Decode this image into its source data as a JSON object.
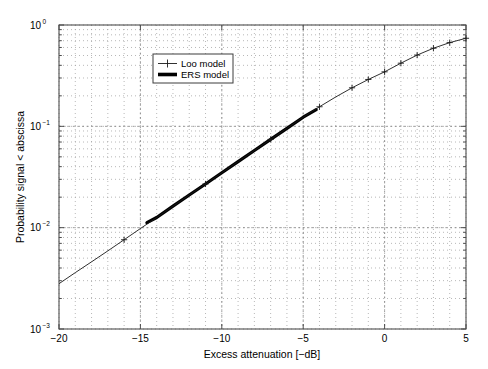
{
  "chart_data": {
    "type": "line",
    "title": "",
    "xlabel": "Excess attenuation [−dB]",
    "ylabel": "Probability signal < abscissa",
    "xlim": [
      -20,
      5
    ],
    "ylim": [
      0.001,
      1
    ],
    "yscale": "log",
    "xscale": "linear",
    "grid": true,
    "grid_style": "dotted-minor-dashed-major",
    "legend_position": "upper-left-inset",
    "xticks": [
      "−20",
      "−15",
      "−10",
      "−5",
      "0",
      "5"
    ],
    "xtick_values": [
      -20,
      -15,
      -10,
      -5,
      0,
      5
    ],
    "yticks": [
      "10^0",
      "10^-1",
      "10^-2",
      "10^-3"
    ],
    "ytick_values": [
      1,
      0.1,
      0.01,
      0.001
    ],
    "ytick_mantissa": [
      "10",
      "10",
      "10",
      "10"
    ],
    "ytick_exponents": [
      "0",
      "−1",
      "−2",
      "−3"
    ],
    "series": [
      {
        "name": "Loo model",
        "style": "thin-line-with-plus-markers",
        "marker": "+",
        "linewidth": 0.9,
        "color": "#1a1a1a",
        "x": [
          -20,
          -19,
          -18,
          -17,
          -16,
          -15,
          -14,
          -13,
          -12,
          -11,
          -10,
          -9,
          -8,
          -7,
          -6,
          -5,
          -4,
          -3,
          -2,
          -1,
          0,
          1,
          2,
          3,
          4,
          5
        ],
        "y": [
          0.0028,
          0.0036,
          0.0046,
          0.0059,
          0.0076,
          0.0098,
          0.0126,
          0.0163,
          0.021,
          0.027,
          0.0348,
          0.0448,
          0.0577,
          0.0743,
          0.0956,
          0.123,
          0.156,
          0.195,
          0.24,
          0.29,
          0.345,
          0.42,
          0.505,
          0.59,
          0.67,
          0.74
        ],
        "marker_x": [
          -16,
          -11,
          -7,
          -4,
          -2,
          -1,
          0,
          1,
          2,
          3,
          4,
          5
        ],
        "marker_y": [
          0.0076,
          0.027,
          0.0743,
          0.156,
          0.24,
          0.29,
          0.345,
          0.42,
          0.505,
          0.59,
          0.67,
          0.74
        ]
      },
      {
        "name": "ERS model",
        "style": "thick-line",
        "marker": "none",
        "linewidth": 3.2,
        "color": "#000000",
        "x": [
          -14.6,
          -14,
          -13,
          -12,
          -11,
          -10,
          -9,
          -8,
          -7,
          -6,
          -5,
          -4.2
        ],
        "y": [
          0.0112,
          0.0126,
          0.0163,
          0.021,
          0.027,
          0.0348,
          0.0448,
          0.0577,
          0.0743,
          0.0956,
          0.123,
          0.146
        ]
      }
    ],
    "annotations": []
  },
  "legend": {
    "entries": [
      {
        "label": "Loo model",
        "swatch": "plus-marker-line"
      },
      {
        "label": "ERS model",
        "swatch": "thick-line"
      }
    ]
  },
  "colors": {
    "axis": "#4d4d4d",
    "grid_minor": "#9a9a9a",
    "grid_major": "#8a8a8a",
    "line_primary": "#1a1a1a",
    "line_secondary": "#000000",
    "background": "#ffffff"
  }
}
